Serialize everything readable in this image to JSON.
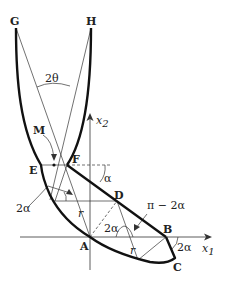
{
  "diagram": {
    "points": {
      "G": "G",
      "H": "H",
      "M": "M",
      "E": "E",
      "F": "F",
      "D": "D",
      "A": "A",
      "B": "B",
      "C": "C"
    },
    "angles": {
      "two_theta": "2θ",
      "alpha": "α",
      "two_alpha_left": "2α",
      "two_alpha_mid": "2α",
      "two_alpha_right": "2α",
      "pi_minus_two_alpha": "π − 2α"
    },
    "radii": {
      "r1": "r",
      "r2": "r"
    },
    "axes": {
      "x1": "x",
      "x1_sub": "1",
      "x2": "x",
      "x2_sub": "2"
    },
    "colors": {
      "stroke": "#111111",
      "thin": "#333333"
    }
  }
}
